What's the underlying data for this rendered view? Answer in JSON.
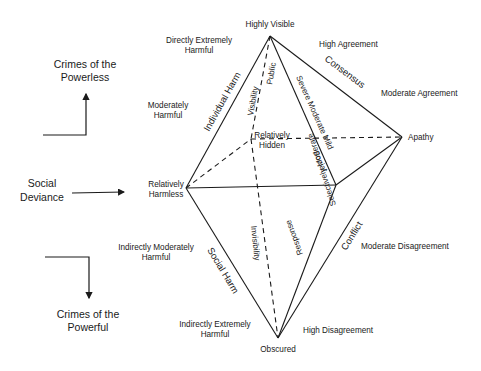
{
  "vertices": {
    "top": "Highly Visible",
    "left": "Relatively Harmless",
    "right": "Apathy",
    "bottom": "Obscured",
    "back": "Relatively Hidden"
  },
  "harm_scale": {
    "directly_extreme": "Directly Extremely Harmful",
    "moderate": "Moderately Harmful",
    "indirect_moderate": "Indirectly Moderately Harmful",
    "indirect_extreme": "Indirectly Extremely Harmful"
  },
  "agreement_scale": {
    "high_agreement": "High Agreement",
    "moderate_agreement": "Moderate Agreement",
    "moderate_disagreement": "Moderate Disagreement",
    "high_disagreement": "High Disagreement"
  },
  "edge_labels": {
    "individual_harm": "Individual Harm",
    "social_harm": "Social Harm",
    "consensus": "Consensus",
    "conflict": "Conflict",
    "visibility": "Visibility",
    "invisibility": "Invisibility",
    "public": "Public",
    "social": "Social",
    "severe_moderate_mild": "Severe Moderate Mild",
    "selectively_moderate": "Selectively Moderate",
    "response": "Response"
  },
  "left_panel": {
    "powerless": [
      "Crimes of the",
      "Powerless"
    ],
    "deviance": [
      "Social",
      "Deviance"
    ],
    "powerful": [
      "Crimes of the",
      "Powerful"
    ]
  }
}
